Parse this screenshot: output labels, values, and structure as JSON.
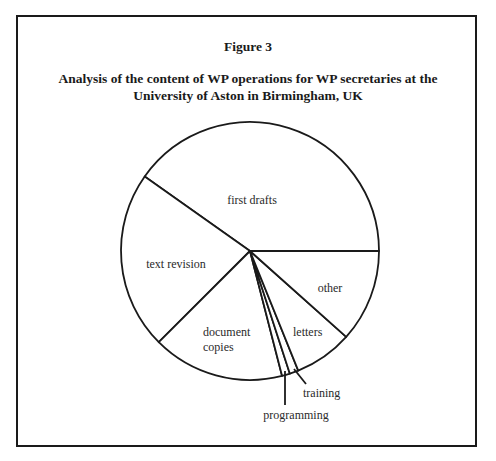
{
  "figure": {
    "number_label": "Figure 3",
    "title": "Analysis of the content of WP operations for WP secretaries at the University of Aston in Birmingham, UK"
  },
  "chart_data": {
    "type": "pie",
    "title": "Analysis of the content of WP operations for WP secretaries at the University of Aston in Birmingham, UK",
    "figure_label": "Figure 3",
    "unit": "percent (estimated from slice angles)",
    "start": "east, counterclockwise",
    "slices": [
      {
        "label": "first drafts",
        "lines": [
          "first drafts"
        ],
        "value": 40.2
      },
      {
        "label": "text revision",
        "lines": [
          "text revision"
        ],
        "value": 22.3
      },
      {
        "label": "document copies",
        "lines": [
          "document",
          "copies"
        ],
        "value": 16.5
      },
      {
        "label": "programming",
        "lines": [
          "programming"
        ],
        "value": 1.0,
        "callout": true
      },
      {
        "label": "training",
        "lines": [
          "training"
        ],
        "value": 1.1,
        "callout": true
      },
      {
        "label": "letters",
        "lines": [
          "letters"
        ],
        "value": 7.3
      },
      {
        "label": "other",
        "lines": [
          "other"
        ],
        "value": 11.6
      }
    ],
    "legend": "none (labels inside slices, callouts for small slices)"
  }
}
